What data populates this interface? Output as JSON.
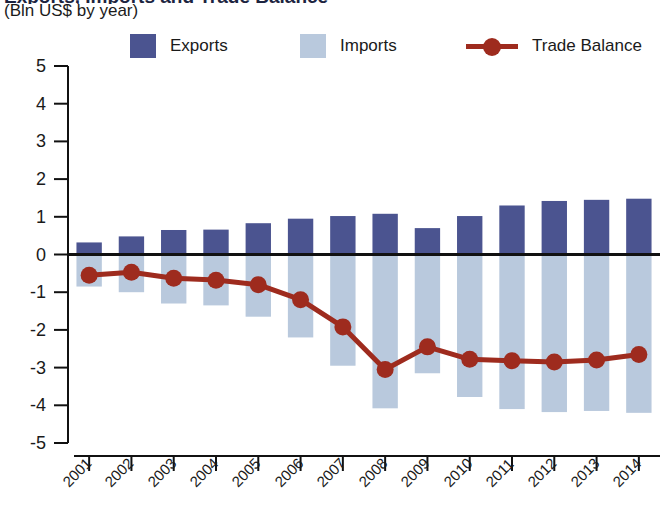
{
  "header": {
    "title_clipped": "Exports, Imports and Trade Balance",
    "subtitle": "(Bln US$ by year)"
  },
  "legend": {
    "position": "top",
    "items": [
      {
        "label": "Exports",
        "marker": "square-swatch",
        "color": "#4b5490"
      },
      {
        "label": "Imports",
        "marker": "square-swatch",
        "color": "#b9c9dd"
      },
      {
        "label": "Trade Balance",
        "marker": "line-with-circle",
        "color": "#9e2b1e"
      }
    ]
  },
  "colors": {
    "exports": "#4b5490",
    "imports": "#b9c9dd",
    "trade_balance": "#9e2b1e",
    "axis": "#111111",
    "zero_line": "#111111"
  },
  "chart_data": {
    "type": "bar",
    "title": "Exports, Imports and Trade Balance",
    "subtitle": "(Bln US$ by year)",
    "xlabel": "",
    "ylabel": "(Bln US$ by year)",
    "ylim": [
      -5,
      5
    ],
    "ytick_step": 1,
    "yticks": [
      "5",
      "4",
      "3",
      "2",
      "1",
      "0",
      "-1",
      "-2",
      "-3",
      "-4",
      "-5"
    ],
    "grid": false,
    "legend_position": "top",
    "categories": [
      "2001",
      "2002",
      "2003",
      "2004",
      "2005",
      "2006",
      "2007",
      "2008",
      "2009",
      "2010",
      "2011",
      "2012",
      "2013",
      "2014"
    ],
    "series": [
      {
        "name": "Exports",
        "type": "bar",
        "color": "#4b5490",
        "values": [
          0.32,
          0.48,
          0.65,
          0.66,
          0.83,
          0.95,
          1.02,
          1.08,
          0.7,
          1.02,
          1.3,
          1.42,
          1.45,
          1.48
        ]
      },
      {
        "name": "Imports",
        "type": "bar",
        "color": "#b9c9dd",
        "values": [
          -0.85,
          -1.0,
          -1.3,
          -1.35,
          -1.65,
          -2.2,
          -2.95,
          -4.08,
          -3.15,
          -3.78,
          -4.1,
          -4.18,
          -4.15,
          -4.2
        ]
      },
      {
        "name": "Trade Balance",
        "type": "line",
        "color": "#9e2b1e",
        "values": [
          -0.55,
          -0.47,
          -0.63,
          -0.68,
          -0.8,
          -1.2,
          -1.92,
          -3.05,
          -2.45,
          -2.78,
          -2.82,
          -2.85,
          -2.8,
          -2.65
        ]
      }
    ]
  }
}
